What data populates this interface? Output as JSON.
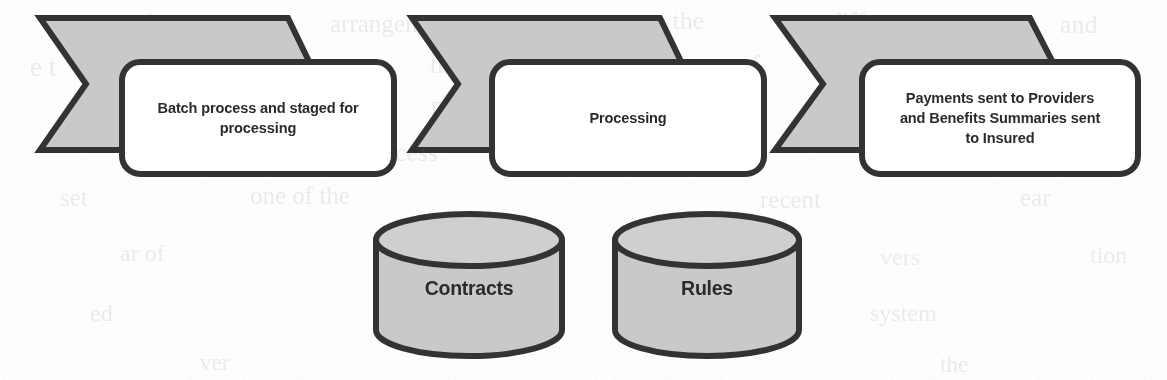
{
  "diagram": {
    "type": "process-flow",
    "background_color": "#fdfdfd",
    "shape_fill": "#c9c9c9",
    "shape_stroke": "#333333",
    "callout_fill": "#ffffff",
    "text_color": "#2b2b2b",
    "steps": [
      {
        "id": "step-1",
        "shape": "chevron",
        "label": "Batch process and staged for processing",
        "lines": [
          "Batch process and staged for",
          "processing"
        ]
      },
      {
        "id": "step-2",
        "shape": "chevron",
        "label": "Processing",
        "lines": [
          "Processing"
        ]
      },
      {
        "id": "step-3",
        "shape": "chevron",
        "label": "Payments sent to Providers and Benefits Summaries sent to Insured",
        "lines": [
          "Payments sent to Providers",
          "and Benefits Summaries sent",
          "to Insured"
        ]
      }
    ],
    "datastores": [
      {
        "id": "datastore-contracts",
        "shape": "cylinder",
        "label": "Contracts"
      },
      {
        "id": "datastore-rules",
        "shape": "cylinder",
        "label": "Rules"
      }
    ],
    "background_artifacts": [
      {
        "text": "the",
        "x": 140,
        "y": 8,
        "size": 26
      },
      {
        "text": "arrangement",
        "x": 330,
        "y": 10,
        "size": 25
      },
      {
        "text": "on the",
        "x": 640,
        "y": 6,
        "size": 26
      },
      {
        "text": "different",
        "x": 830,
        "y": 8,
        "size": 25
      },
      {
        "text": "and",
        "x": 1060,
        "y": 10,
        "size": 26
      },
      {
        "text": "e t",
        "x": 30,
        "y": 52,
        "size": 27
      },
      {
        "text": "no that",
        "x": 190,
        "y": 48,
        "size": 26
      },
      {
        "text": "they correspond to the stages of",
        "x": 430,
        "y": 50,
        "size": 26
      },
      {
        "text": "in the",
        "x": 70,
        "y": 96,
        "size": 28
      },
      {
        "text": "BOU",
        "x": 430,
        "y": 96,
        "size": 27
      },
      {
        "text": "ed to lot",
        "x": 600,
        "y": 94,
        "size": 26
      },
      {
        "text": "business",
        "x": 930,
        "y": 94,
        "size": 26
      },
      {
        "text": "the",
        "x": 140,
        "y": 140,
        "size": 27
      },
      {
        "text": "process",
        "x": 360,
        "y": 138,
        "size": 26
      },
      {
        "text": "g the",
        "x": 690,
        "y": 138,
        "size": 26
      },
      {
        "text": "there",
        "x": 960,
        "y": 136,
        "size": 27
      },
      {
        "text": "set",
        "x": 60,
        "y": 184,
        "size": 25
      },
      {
        "text": "one of the",
        "x": 250,
        "y": 182,
        "size": 25
      },
      {
        "text": "recent",
        "x": 760,
        "y": 186,
        "size": 25
      },
      {
        "text": "ear",
        "x": 1020,
        "y": 184,
        "size": 25
      },
      {
        "text": "ar of",
        "x": 120,
        "y": 240,
        "size": 24
      },
      {
        "text": "vers",
        "x": 880,
        "y": 244,
        "size": 24
      },
      {
        "text": "tion",
        "x": 1090,
        "y": 242,
        "size": 24
      },
      {
        "text": "ed",
        "x": 90,
        "y": 300,
        "size": 24
      },
      {
        "text": "system",
        "x": 870,
        "y": 300,
        "size": 24
      },
      {
        "text": "ver",
        "x": 200,
        "y": 350,
        "size": 23
      },
      {
        "text": "the",
        "x": 940,
        "y": 352,
        "size": 23
      }
    ]
  }
}
